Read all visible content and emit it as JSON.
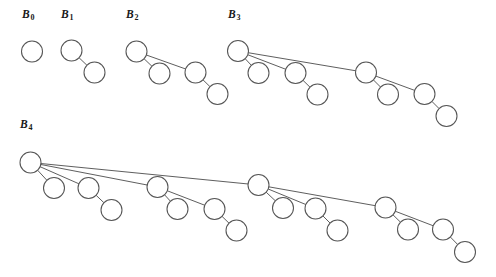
{
  "figure": {
    "type": "binomial-trees-diagram",
    "width": 496,
    "height": 277,
    "background_color": "#ffffff",
    "stroke_color": "#555555",
    "node_fill_color": "#ffffff",
    "node_radius": 10.5,
    "label_color": "#1a1a1a"
  },
  "labels": [
    {
      "id": "label-b0",
      "base": "B",
      "subscript": "0",
      "x": 22,
      "y": 8
    },
    {
      "id": "label-b1",
      "base": "B",
      "subscript": "1",
      "x": 61,
      "y": 8
    },
    {
      "id": "label-b2",
      "base": "B",
      "subscript": "2",
      "x": 126,
      "y": 8
    },
    {
      "id": "label-b3",
      "base": "B",
      "subscript": "3",
      "x": 228,
      "y": 8
    },
    {
      "id": "label-b4",
      "base": "B",
      "subscript": "4",
      "x": 20,
      "y": 118
    }
  ],
  "trees": [
    {
      "name": "B0",
      "order": 0,
      "node_count": 1,
      "nodes": [
        {
          "id": "b0-n0",
          "x": 32,
          "y": 51.5
        }
      ],
      "edges": []
    },
    {
      "name": "B1",
      "order": 1,
      "node_count": 2,
      "nodes": [
        {
          "id": "b1-n0",
          "x": 71.5,
          "y": 50.5
        },
        {
          "id": "b1-n1",
          "x": 94.5,
          "y": 72.5
        }
      ],
      "edges": [
        {
          "from": "b1-n0",
          "to": "b1-n1"
        }
      ]
    },
    {
      "name": "B2",
      "order": 2,
      "node_count": 4,
      "nodes": [
        {
          "id": "b2-n0",
          "x": 136.5,
          "y": 51.5
        },
        {
          "id": "b2-n1",
          "x": 159.5,
          "y": 73.5
        },
        {
          "id": "b2-n2",
          "x": 195.5,
          "y": 72.5
        },
        {
          "id": "b2-n3",
          "x": 217.5,
          "y": 94
        }
      ],
      "edges": [
        {
          "from": "b2-n0",
          "to": "b2-n1"
        },
        {
          "from": "b2-n0",
          "to": "b2-n2"
        },
        {
          "from": "b2-n2",
          "to": "b2-n3"
        }
      ]
    },
    {
      "name": "B3",
      "order": 3,
      "node_count": 8,
      "nodes": [
        {
          "id": "b3-n0",
          "x": 238,
          "y": 51
        },
        {
          "id": "b3-n1",
          "x": 258.5,
          "y": 73
        },
        {
          "id": "b3-n2",
          "x": 295.5,
          "y": 73
        },
        {
          "id": "b3-n3",
          "x": 317.5,
          "y": 94.5
        },
        {
          "id": "b3-n4",
          "x": 366,
          "y": 72.5
        },
        {
          "id": "b3-n5",
          "x": 388,
          "y": 94.5
        },
        {
          "id": "b3-n6",
          "x": 424.5,
          "y": 94
        },
        {
          "id": "b3-n7",
          "x": 446.5,
          "y": 116
        }
      ],
      "edges": [
        {
          "from": "b3-n0",
          "to": "b3-n1"
        },
        {
          "from": "b3-n0",
          "to": "b3-n2"
        },
        {
          "from": "b3-n2",
          "to": "b3-n3"
        },
        {
          "from": "b3-n0",
          "to": "b3-n4"
        },
        {
          "from": "b3-n4",
          "to": "b3-n5"
        },
        {
          "from": "b3-n4",
          "to": "b3-n6"
        },
        {
          "from": "b3-n6",
          "to": "b3-n7"
        }
      ]
    },
    {
      "name": "B4",
      "order": 4,
      "node_count": 16,
      "nodes": [
        {
          "id": "b4-n0",
          "x": 30.5,
          "y": 162.5
        },
        {
          "id": "b4-n1",
          "x": 54,
          "y": 188
        },
        {
          "id": "b4-n2",
          "x": 88.5,
          "y": 188
        },
        {
          "id": "b4-n3",
          "x": 111.5,
          "y": 210
        },
        {
          "id": "b4-n4",
          "x": 157.5,
          "y": 187
        },
        {
          "id": "b4-n5",
          "x": 177.5,
          "y": 209
        },
        {
          "id": "b4-n6",
          "x": 214.5,
          "y": 209
        },
        {
          "id": "b4-n7",
          "x": 236.5,
          "y": 230.5
        },
        {
          "id": "b4-n8",
          "x": 258.5,
          "y": 185
        },
        {
          "id": "b4-n9",
          "x": 283,
          "y": 208
        },
        {
          "id": "b4-n10",
          "x": 315.5,
          "y": 208.5
        },
        {
          "id": "b4-n11",
          "x": 337.5,
          "y": 230.5
        },
        {
          "id": "b4-n12",
          "x": 385.5,
          "y": 207.5
        },
        {
          "id": "b4-n13",
          "x": 408,
          "y": 229.5
        },
        {
          "id": "b4-n14",
          "x": 443,
          "y": 229.5
        },
        {
          "id": "b4-n15",
          "x": 465,
          "y": 252
        }
      ],
      "edges": [
        {
          "from": "b4-n0",
          "to": "b4-n1"
        },
        {
          "from": "b4-n0",
          "to": "b4-n2"
        },
        {
          "from": "b4-n2",
          "to": "b4-n3"
        },
        {
          "from": "b4-n0",
          "to": "b4-n4"
        },
        {
          "from": "b4-n4",
          "to": "b4-n5"
        },
        {
          "from": "b4-n4",
          "to": "b4-n6"
        },
        {
          "from": "b4-n6",
          "to": "b4-n7"
        },
        {
          "from": "b4-n0",
          "to": "b4-n8"
        },
        {
          "from": "b4-n8",
          "to": "b4-n9"
        },
        {
          "from": "b4-n8",
          "to": "b4-n10"
        },
        {
          "from": "b4-n10",
          "to": "b4-n11"
        },
        {
          "from": "b4-n8",
          "to": "b4-n12"
        },
        {
          "from": "b4-n12",
          "to": "b4-n13"
        },
        {
          "from": "b4-n12",
          "to": "b4-n14"
        },
        {
          "from": "b4-n14",
          "to": "b4-n15"
        }
      ]
    }
  ]
}
